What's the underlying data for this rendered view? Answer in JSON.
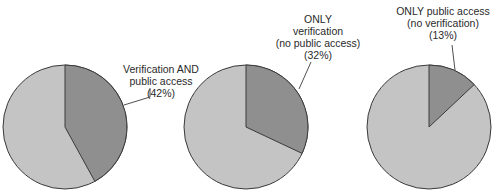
{
  "chart_data": [
    {
      "type": "pie",
      "title": "",
      "categories": [
        "Verification AND public access",
        "Other"
      ],
      "values": [
        42,
        58
      ],
      "highlight": {
        "label_lines": [
          "Verification AND",
          "public access",
          "(42%)"
        ],
        "value": 42
      },
      "colors": {
        "highlight": "#8f8f8f",
        "rest": "#c4c4c4"
      }
    },
    {
      "type": "pie",
      "title": "",
      "categories": [
        "ONLY verification (no public access)",
        "Other"
      ],
      "values": [
        32,
        68
      ],
      "highlight": {
        "label_lines": [
          "ONLY",
          "verification",
          "(no public access)",
          "(32%)"
        ],
        "value": 32
      },
      "colors": {
        "highlight": "#8f8f8f",
        "rest": "#c4c4c4"
      }
    },
    {
      "type": "pie",
      "title": "",
      "categories": [
        "ONLY public access (no verification)",
        "Other"
      ],
      "values": [
        13,
        87
      ],
      "highlight": {
        "label_lines": [
          "ONLY public access",
          "(no verification)",
          "(13%)"
        ],
        "value": 13
      },
      "colors": {
        "highlight": "#8f8f8f",
        "rest": "#c4c4c4"
      }
    }
  ],
  "labels": {
    "pie1": [
      "Verification AND",
      "public access",
      "(42%)"
    ],
    "pie2": [
      "ONLY",
      "verification",
      "(no public access)",
      "(32%)"
    ],
    "pie3": [
      "ONLY public access",
      "(no verification)",
      "(13%)"
    ]
  }
}
